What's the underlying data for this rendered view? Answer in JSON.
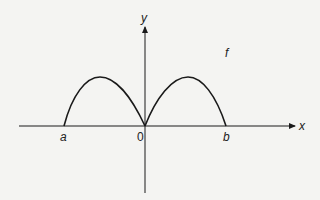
{
  "diagram": {
    "function_label": "f",
    "axes": {
      "x_label": "x",
      "y_label": "y",
      "origin_label": "0"
    },
    "points": {
      "left_root": "a",
      "right_root": "b"
    },
    "curve": {
      "description": "Two arch-shaped humps: one from a to 0, one from 0 to b, meeting in a cusp at the origin",
      "color": "#1a1a1a"
    },
    "colors": {
      "background": "#f4f4f2",
      "ink": "#1a1a1a"
    }
  }
}
